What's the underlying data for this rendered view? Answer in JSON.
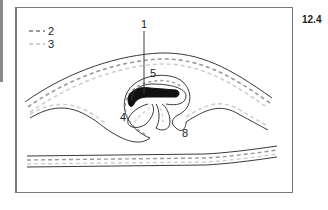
{
  "figure": {
    "number": "12.4",
    "legend": [
      {
        "key": "2",
        "style": "dashed-dark"
      },
      {
        "key": "3",
        "style": "dashed-light"
      }
    ],
    "labels": {
      "l1": "1",
      "l4": "4",
      "l5": "5",
      "l8": "8"
    },
    "colors": {
      "outline": "#3a3a3a",
      "dash_dark": "#9a9a9a",
      "dash_light": "#cfcfcf",
      "fill_dark": "#111111"
    }
  }
}
